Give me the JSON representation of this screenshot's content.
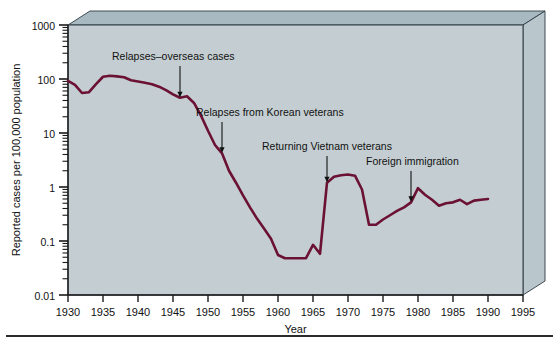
{
  "figure": {
    "background_color": "#ffffff",
    "plot_fill_color": "#c4ced2",
    "plot_top_face_color": "#a9b9c2",
    "plot_right_face_color": "#b9c6cc",
    "line_color": "#6b1133",
    "axis_color": "#1a1a1a",
    "text_color": "#111111"
  },
  "axes": {
    "x_title": "Year",
    "y_title": "Reported cases per 100,000 population",
    "x_ticks": [
      "1930",
      "1935",
      "1940",
      "1945",
      "1950",
      "1955",
      "1960",
      "1965",
      "1970",
      "1975",
      "1980",
      "1985",
      "1990",
      "1995"
    ],
    "y_ticks": [
      "1000",
      "100",
      "10",
      "1",
      "0.1",
      "0.01"
    ]
  },
  "annotations": [
    {
      "id": "relapses-overseas",
      "label": "Relapses–overseas cases",
      "year": 1946,
      "value": 45
    },
    {
      "id": "relapses-korean",
      "label": "Relapses from Korean veterans",
      "year": 1952,
      "value": 4.2
    },
    {
      "id": "returning-vietnam",
      "label": "Returning Vietnam veterans",
      "year": 1967,
      "value": 1.2
    },
    {
      "id": "foreign-immigration",
      "label": "Foreign immigration",
      "year": 1979,
      "value": 0.52
    }
  ],
  "chart_data": {
    "type": "line",
    "title": "",
    "xlabel": "Year",
    "ylabel": "Reported cases per 100,000 population",
    "xlim": [
      1930,
      1995
    ],
    "ylim": [
      0.01,
      1000
    ],
    "yscale": "log",
    "grid": false,
    "legend": null,
    "series": [
      {
        "name": "Reported cases per 100,000 population",
        "color": "#6b1133",
        "x": [
          1930,
          1931,
          1932,
          1933,
          1934,
          1935,
          1936,
          1937,
          1938,
          1939,
          1940,
          1941,
          1942,
          1943,
          1944,
          1945,
          1946,
          1947,
          1948,
          1949,
          1950,
          1951,
          1952,
          1953,
          1954,
          1955,
          1956,
          1957,
          1958,
          1959,
          1960,
          1961,
          1962,
          1963,
          1964,
          1965,
          1966,
          1967,
          1968,
          1969,
          1970,
          1971,
          1972,
          1973,
          1974,
          1975,
          1976,
          1977,
          1978,
          1979,
          1980,
          1981,
          1982,
          1983,
          1984,
          1985,
          1986,
          1987,
          1988,
          1989,
          1990
        ],
        "values": [
          92,
          78,
          55,
          57,
          80,
          110,
          115,
          112,
          108,
          95,
          90,
          85,
          80,
          72,
          62,
          52,
          45,
          48,
          36,
          21,
          11,
          6.0,
          4.2,
          2.0,
          1.2,
          0.7,
          0.42,
          0.26,
          0.17,
          0.11,
          0.055,
          0.048,
          0.048,
          0.048,
          0.048,
          0.085,
          0.058,
          1.2,
          1.55,
          1.65,
          1.7,
          1.62,
          0.9,
          0.2,
          0.2,
          0.25,
          0.3,
          0.36,
          0.42,
          0.52,
          0.95,
          0.72,
          0.58,
          0.45,
          0.5,
          0.52,
          0.58,
          0.48,
          0.56,
          0.58,
          0.6
        ]
      }
    ]
  }
}
